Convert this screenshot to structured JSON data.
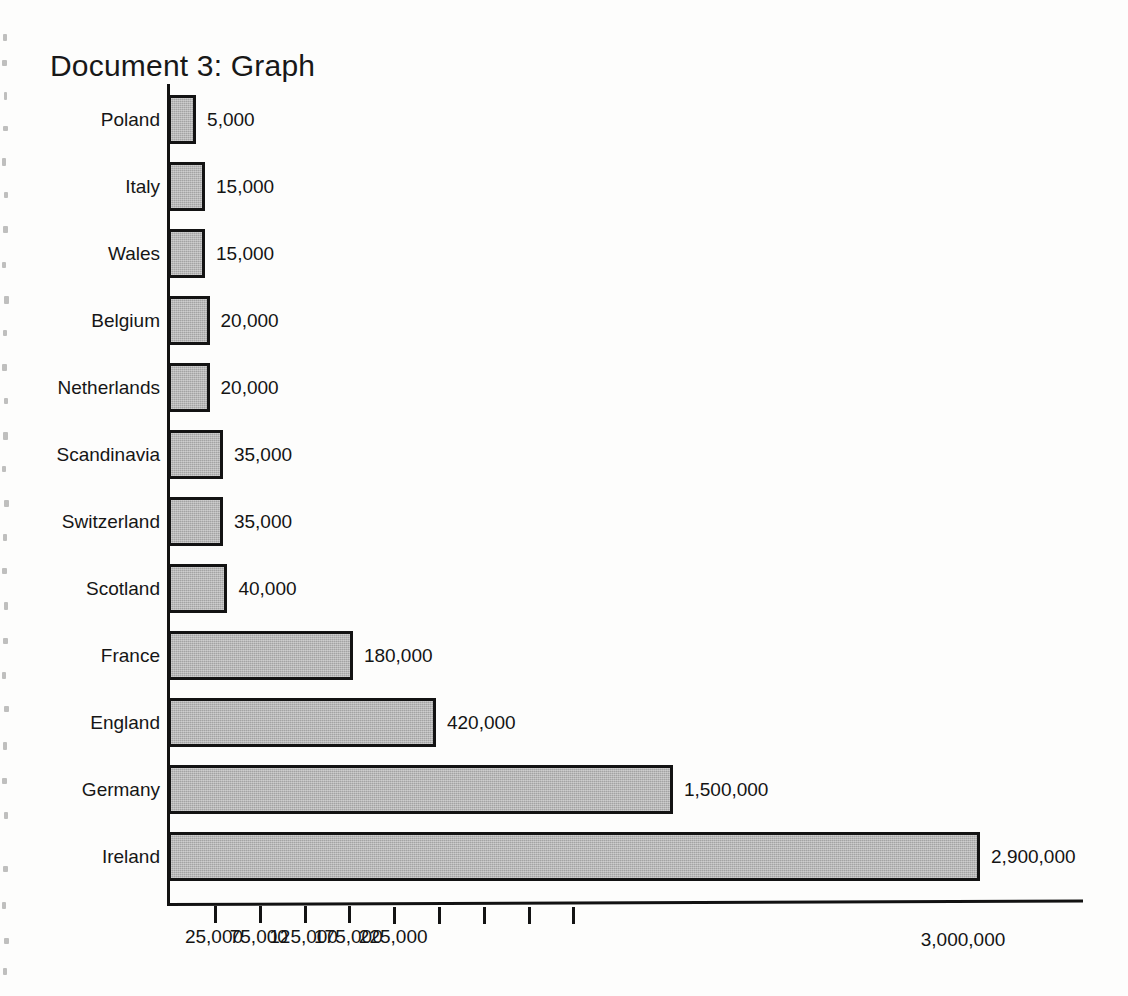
{
  "document": {
    "title": "Document 3: Graph"
  },
  "chart_data": {
    "type": "bar",
    "orientation": "horizontal",
    "title": "Document 3: Graph",
    "xlabel": "",
    "ylabel": "",
    "grid": false,
    "legend": null,
    "categories": [
      "Poland",
      "Italy",
      "Wales",
      "Belgium",
      "Netherlands",
      "Scandinavia",
      "Switzerland",
      "Scotland",
      "France",
      "England",
      "Germany",
      "Ireland"
    ],
    "values": [
      5000,
      15000,
      15000,
      20000,
      20000,
      35000,
      35000,
      40000,
      180000,
      420000,
      1500000,
      2900000
    ],
    "value_labels": [
      "5,000",
      "15,000",
      "15,000",
      "20,000",
      "20,000",
      "35,000",
      "35,000",
      "40,000",
      "180,000",
      "420,000",
      "1,500,000",
      "2,900,000"
    ],
    "x_tick_labels": [
      "25,000",
      "75,000",
      "125,000",
      "175,000",
      "225,000",
      "3,000,000"
    ],
    "x_ticks": [
      25000,
      75000,
      125000,
      175000,
      225000,
      3000000
    ],
    "xlim": [
      0,
      3000000
    ],
    "bar_fill_color": "#a3a3a3",
    "bar_edge_color": "#131313",
    "axis_color": "#121212",
    "background_color": "#ffffff"
  }
}
